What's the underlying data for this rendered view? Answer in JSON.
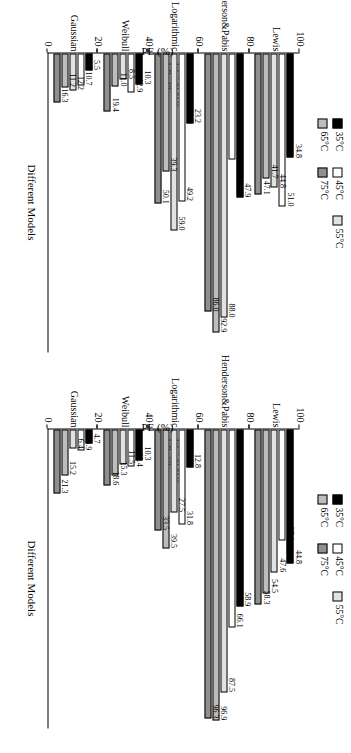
{
  "figure": {
    "orientation_deg": 90,
    "axis": {
      "y_label": "PE (%)",
      "x_label": "Different Models",
      "y_ticks": [
        "0",
        "20",
        "40",
        "60",
        "80",
        "100"
      ],
      "y_min": 0,
      "y_max": 100
    },
    "legend": [
      {
        "label": "35°C",
        "color": "#000000",
        "key": "c35"
      },
      {
        "label": "45°C",
        "color": "#ffffff",
        "key": "c45"
      },
      {
        "label": "55°C",
        "color": "#e2e2e2",
        "key": "c55"
      },
      {
        "label": "65°C",
        "color": "#bdbdbd",
        "key": "c65"
      },
      {
        "label": "75°C",
        "color": "#8f8f8f",
        "key": "c75"
      }
    ]
  },
  "chart_data": [
    {
      "type": "bar",
      "title": "",
      "annotation_line1": "UF=38 kHz",
      "annotation_line2": "UP=40w",
      "xlabel": "Different Models",
      "ylabel": "PE (%)",
      "ylim": [
        0,
        100
      ],
      "grid": false,
      "legend_position": "top",
      "categories": [
        "Lewis",
        "Henderson&Pabis",
        "Logarithmic",
        "Weibull",
        "Gaussian"
      ],
      "series": [
        {
          "name": "35°C",
          "values": [
            34.8,
            47.9,
            23.2,
            10.3,
            5.5
          ]
        },
        {
          "name": "45°C",
          "values": [
            51.0,
            35.4,
            49.2,
            12.9,
            10.7
          ]
        },
        {
          "name": "55°C",
          "values": [
            44.8,
            88.0,
            59.0,
            8.5,
            12.2
          ]
        },
        {
          "name": "65°C",
          "values": [
            41.7,
            92.9,
            39.3,
            11.0,
            11.2
          ]
        },
        {
          "name": "75°C",
          "values": [
            47.1,
            86.0,
            50.1,
            19.4,
            16.3
          ]
        }
      ]
    },
    {
      "type": "bar",
      "title": "",
      "annotation_line1": "UF=38 kHz",
      "annotation_line2": "UP=60w",
      "xlabel": "Different Models",
      "ylabel": "PE (%)",
      "ylim": [
        0,
        100
      ],
      "grid": false,
      "legend_position": "top",
      "categories": [
        "Lewis",
        "Henderson&Pabis",
        "Logarithmic",
        "Weibull",
        "Gaussian"
      ],
      "series": [
        {
          "name": "35°C",
          "values": [
            44.8,
            58.9,
            12.8,
            10.3,
            4.7
          ]
        },
        {
          "name": "45°C",
          "values": [
            37.1,
            66.1,
            31.8,
            12.4,
            6.9
          ]
        },
        {
          "name": "55°C",
          "values": [
            47.6,
            87.5,
            27.5,
            11.5,
            6.4
          ]
        },
        {
          "name": "65°C",
          "values": [
            54.5,
            96.9,
            39.5,
            15.3,
            15.2
          ]
        },
        {
          "name": "75°C",
          "values": [
            58.3,
            96.3,
            33.5,
            18.6,
            21.3
          ]
        }
      ]
    }
  ]
}
